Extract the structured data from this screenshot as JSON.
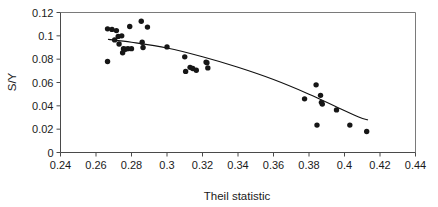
{
  "chart_data": {
    "type": "scatter",
    "title": "",
    "xlabel": "Theil statistic",
    "ylabel": "S/Y",
    "xlim": [
      0.24,
      0.44
    ],
    "ylim": [
      0,
      0.12
    ],
    "xticks": [
      0.24,
      0.26,
      0.28,
      0.3,
      0.32,
      0.34,
      0.36,
      0.38,
      0.4,
      0.42,
      0.44
    ],
    "xticklabels": [
      "0.24",
      "0.26",
      "0.28",
      "0.3",
      "0.32",
      "0.34",
      "0.36",
      "0.38",
      "0.4",
      "0.42",
      "0.44"
    ],
    "yticks": [
      0,
      0.02,
      0.04,
      0.06,
      0.08,
      0.1,
      0.12
    ],
    "yticklabels": [
      "0",
      "0.02",
      "0.04",
      "0.06",
      "0.08",
      "0.1",
      "0.12"
    ],
    "grid": false,
    "legend": "none",
    "marker_color": "#161616",
    "line_color": "#111111",
    "points": [
      {
        "x": 0.2665,
        "y": 0.106
      },
      {
        "x": 0.269,
        "y": 0.1055
      },
      {
        "x": 0.2665,
        "y": 0.078
      },
      {
        "x": 0.2705,
        "y": 0.0965
      },
      {
        "x": 0.2715,
        "y": 0.1045
      },
      {
        "x": 0.2725,
        "y": 0.0995
      },
      {
        "x": 0.273,
        "y": 0.093
      },
      {
        "x": 0.2745,
        "y": 0.1
      },
      {
        "x": 0.275,
        "y": 0.0855
      },
      {
        "x": 0.2755,
        "y": 0.089
      },
      {
        "x": 0.2765,
        "y": 0.0885
      },
      {
        "x": 0.278,
        "y": 0.089
      },
      {
        "x": 0.279,
        "y": 0.108
      },
      {
        "x": 0.28,
        "y": 0.089
      },
      {
        "x": 0.2855,
        "y": 0.1125
      },
      {
        "x": 0.286,
        "y": 0.0945
      },
      {
        "x": 0.2865,
        "y": 0.09
      },
      {
        "x": 0.289,
        "y": 0.1075
      },
      {
        "x": 0.3,
        "y": 0.0905
      },
      {
        "x": 0.31,
        "y": 0.082
      },
      {
        "x": 0.3105,
        "y": 0.0695
      },
      {
        "x": 0.313,
        "y": 0.073
      },
      {
        "x": 0.3145,
        "y": 0.072
      },
      {
        "x": 0.3165,
        "y": 0.0705
      },
      {
        "x": 0.322,
        "y": 0.0775
      },
      {
        "x": 0.3225,
        "y": 0.077
      },
      {
        "x": 0.323,
        "y": 0.0725
      },
      {
        "x": 0.3775,
        "y": 0.046
      },
      {
        "x": 0.384,
        "y": 0.058
      },
      {
        "x": 0.3845,
        "y": 0.0235
      },
      {
        "x": 0.3865,
        "y": 0.049
      },
      {
        "x": 0.387,
        "y": 0.043
      },
      {
        "x": 0.3875,
        "y": 0.0415
      },
      {
        "x": 0.3955,
        "y": 0.0365
      },
      {
        "x": 0.403,
        "y": 0.0235
      },
      {
        "x": 0.4125,
        "y": 0.018
      }
    ],
    "trend_line": [
      {
        "x": 0.267,
        "y": 0.097
      },
      {
        "x": 0.28,
        "y": 0.0945
      },
      {
        "x": 0.3,
        "y": 0.0895
      },
      {
        "x": 0.32,
        "y": 0.082
      },
      {
        "x": 0.34,
        "y": 0.073
      },
      {
        "x": 0.36,
        "y": 0.0625
      },
      {
        "x": 0.38,
        "y": 0.05
      },
      {
        "x": 0.395,
        "y": 0.0395
      },
      {
        "x": 0.408,
        "y": 0.0305
      },
      {
        "x": 0.413,
        "y": 0.028
      }
    ]
  }
}
